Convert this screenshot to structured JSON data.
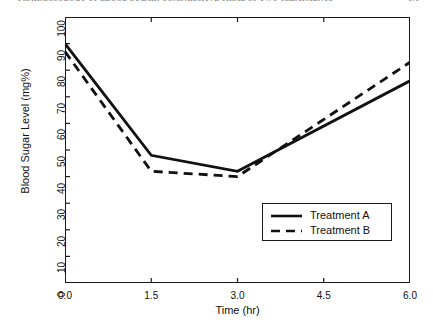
{
  "page": {
    "running_header": "PHARMACOLOGY OF BLOOD SUGAR: COMPARATIVE TRIAL OF TWO TREATMENTS",
    "page_number": "179"
  },
  "legend": {
    "position": "lower-right",
    "entries": [
      {
        "label": "Treatment A",
        "style": "solid"
      },
      {
        "label": "Treatment B",
        "style": "dashed"
      }
    ]
  },
  "chart_data": {
    "type": "line",
    "title": "",
    "xlabel": "Time (hr)",
    "ylabel": "Blood Sugar Level (mg%)",
    "xlim": [
      0.0,
      6.0
    ],
    "ylim": [
      0,
      100
    ],
    "xticks": [
      "0.0",
      "1.5",
      "3.0",
      "4.5",
      "6.0"
    ],
    "xtick_values": [
      0.0,
      1.5,
      3.0,
      4.5,
      6.0
    ],
    "yticks": [
      "0",
      "10",
      "20",
      "30",
      "40",
      "50",
      "60",
      "70",
      "80",
      "90",
      "100"
    ],
    "ytick_values": [
      0,
      10,
      20,
      30,
      40,
      50,
      60,
      70,
      80,
      90,
      100
    ],
    "grid": false,
    "x": [
      0.0,
      1.5,
      3.0,
      6.0
    ],
    "series": [
      {
        "name": "Treatment A",
        "style": "solid",
        "color": "#111111",
        "values": [
          90,
          48,
          42,
          76
        ]
      },
      {
        "name": "Treatment B",
        "style": "dashed",
        "color": "#111111",
        "values": [
          87,
          42,
          40,
          83
        ]
      }
    ]
  }
}
